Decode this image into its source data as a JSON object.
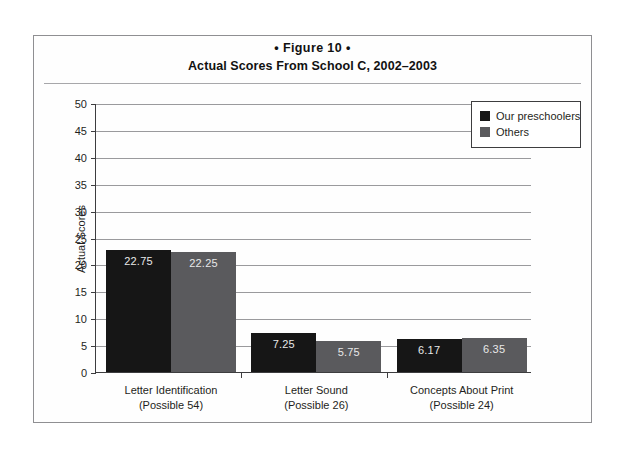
{
  "figure": {
    "number_label": "• Figure 10 •",
    "title": "Actual Scores From School C, 2002–2003"
  },
  "chart_data": {
    "type": "bar",
    "title": "Actual Scores From School C, 2002–2003",
    "subtitle": "• Figure 10 •",
    "xlabel": "",
    "ylabel": "Actual Scores",
    "ylim": [
      0,
      50
    ],
    "ytick_step": 5,
    "yticks": [
      0,
      5,
      10,
      15,
      20,
      25,
      30,
      35,
      40,
      45,
      50
    ],
    "ytick_labels": [
      "0",
      "5",
      "10",
      "15",
      "20",
      "25",
      "30",
      "35",
      "40",
      "45",
      "50"
    ],
    "grid": "horizontal",
    "legend_position": "top-right",
    "categories": [
      "Letter Identification",
      "Letter Sound",
      "Concepts About Print"
    ],
    "category_sublabels": [
      "(Possible 54)",
      "(Possible 26)",
      "(Possible 24)"
    ],
    "series": [
      {
        "name": "Our preschoolers",
        "color": "#161616",
        "values": [
          22.75,
          7.25,
          6.17
        ],
        "value_labels": [
          "22.75",
          "7.25",
          "6.17"
        ]
      },
      {
        "name": "Others",
        "color": "#5a5a5d",
        "values": [
          22.25,
          5.75,
          6.35
        ],
        "value_labels": [
          "22.25",
          "5.75",
          "6.35"
        ]
      }
    ]
  }
}
